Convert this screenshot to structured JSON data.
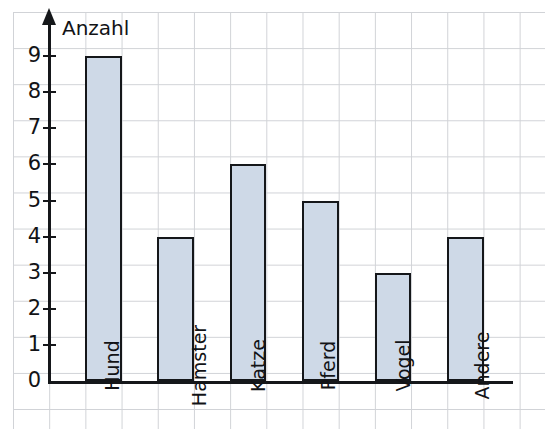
{
  "chart_data": {
    "type": "bar",
    "title": "",
    "xlabel": "",
    "ylabel": "Anzahl",
    "ylim": [
      0,
      9
    ],
    "ytick_labels": [
      "9",
      "8",
      "7",
      "6",
      "5",
      "4",
      "3",
      "2",
      "1",
      "0"
    ],
    "ytick_values": [
      9,
      8,
      7,
      6,
      5,
      4,
      3,
      2,
      1,
      0
    ],
    "grid": true,
    "legend": "none",
    "categories": [
      "Hund",
      "Hamster",
      "Katze",
      "Pferd",
      "Vogel",
      "Andere"
    ],
    "values": [
      9,
      4,
      6,
      5,
      3,
      4
    ],
    "bar_fill_color": "#ced9e7",
    "bar_edge_color": "#15171a",
    "axis_color": "#15171a",
    "grid_color": "#b9bcc2",
    "background_color": "#ffffff"
  },
  "axis": {
    "y_title": "Anzahl",
    "y_arrow_icon": "axis-arrow-up-icon"
  }
}
